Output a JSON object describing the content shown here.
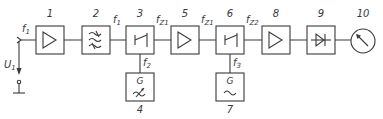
{
  "diagram": {
    "type": "block-diagram",
    "colors": {
      "line": "#3a3a3a",
      "background": "#ffffff"
    },
    "input": {
      "signal": "f",
      "signal_sub": "1",
      "voltage": "U",
      "voltage_sub": "1"
    },
    "blocks": [
      {
        "id": "1",
        "label": "1",
        "kind": "amplifier"
      },
      {
        "id": "2",
        "label": "2",
        "kind": "filter"
      },
      {
        "id": "3",
        "label": "3",
        "kind": "mixer"
      },
      {
        "id": "4",
        "label": "4",
        "kind": "tunable-generator",
        "glyph": "G"
      },
      {
        "id": "5",
        "label": "5",
        "kind": "amplifier"
      },
      {
        "id": "6",
        "label": "6",
        "kind": "mixer"
      },
      {
        "id": "7",
        "label": "7",
        "kind": "fixed-generator",
        "glyph": "G"
      },
      {
        "id": "8",
        "label": "8",
        "kind": "amplifier"
      },
      {
        "id": "9",
        "label": "9",
        "kind": "detector"
      },
      {
        "id": "10",
        "label": "10",
        "kind": "meter"
      }
    ],
    "signals": {
      "after_input": {
        "main": "f",
        "sub": "1"
      },
      "after_filter": {
        "main": "f",
        "sub": "1"
      },
      "mixer1_out": {
        "main": "f",
        "sub": "Z1"
      },
      "amp5_out": {
        "main": "f",
        "sub": "Z1"
      },
      "mixer2_out": {
        "main": "f",
        "sub": "Z2"
      },
      "gen4_out": {
        "main": "f",
        "sub": "2"
      },
      "gen7_out": {
        "main": "f",
        "sub": "3"
      }
    }
  }
}
